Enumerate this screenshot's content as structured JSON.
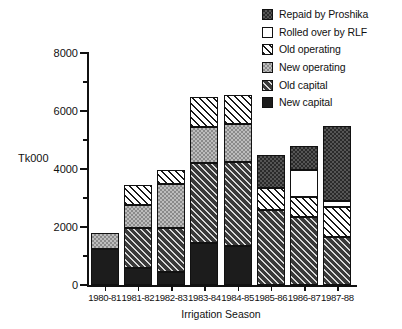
{
  "chart_data": {
    "type": "bar",
    "stacked": true,
    "title": "",
    "xlabel": "Irrigation Season",
    "ylabel": "Tk000",
    "ylim": [
      0,
      8000
    ],
    "ytick_labels": [
      "0",
      "2000",
      "4000",
      "6000",
      "8000"
    ],
    "ytick_values": [
      0,
      2000,
      4000,
      6000,
      8000
    ],
    "yminor_values": [
      1000,
      3000,
      5000,
      7000
    ],
    "grid": false,
    "legend_position": "top-right",
    "categories": [
      "1980-81",
      "1981-82",
      "1982-83",
      "1983-84",
      "1984-85",
      "1985-86",
      "1986-87",
      "1987-88"
    ],
    "series": [
      {
        "name": "New capital",
        "swatch": "solid-black",
        "color": "#1c1c1c",
        "values": [
          1250,
          600,
          450,
          1450,
          1350,
          0,
          0,
          0
        ]
      },
      {
        "name": "Old capital",
        "swatch": "dark-diagonal-hatch",
        "color": "#3a3a3a",
        "values": [
          0,
          1350,
          1500,
          2750,
          2900,
          2600,
          2350,
          1650
        ]
      },
      {
        "name": "New operating",
        "swatch": "gray-checker",
        "color": "#bdbdbd",
        "values": [
          550,
          800,
          1550,
          1250,
          1300,
          0,
          0,
          0
        ]
      },
      {
        "name": "Old operating",
        "swatch": "light-diagonal-hatch",
        "color": "#ffffff",
        "values": [
          0,
          700,
          450,
          1050,
          1000,
          750,
          700,
          1050
        ]
      },
      {
        "name": "Rolled over by RLF",
        "swatch": "white-open",
        "color": "#ffffff",
        "values": [
          0,
          0,
          0,
          0,
          0,
          0,
          900,
          200
        ]
      },
      {
        "name": "Repaid by Proshika",
        "swatch": "dark-checker",
        "color": "#2a2a2a",
        "values": [
          0,
          0,
          0,
          0,
          0,
          1150,
          850,
          2580
        ]
      }
    ],
    "totals": [
      1800,
      3450,
      3950,
      6500,
      6550,
      4500,
      4800,
      5480
    ]
  },
  "legend": {
    "items": [
      {
        "label": "Repaid by Proshika",
        "fill": "fill-repaid"
      },
      {
        "label": "Rolled over by RLF",
        "fill": "fill-rolled"
      },
      {
        "label": "Old operating",
        "fill": "fill-oldop"
      },
      {
        "label": "New operating",
        "fill": "fill-newop"
      },
      {
        "label": "Old capital",
        "fill": "fill-oldcap"
      },
      {
        "label": "New capital",
        "fill": "fill-newcap"
      }
    ]
  }
}
